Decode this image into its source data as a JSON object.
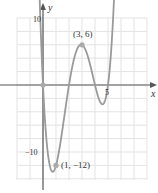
{
  "chart_data": {
    "type": "line",
    "title": "",
    "xlabel": "x",
    "ylabel": "y",
    "function": "f(x) = x(x-2)(x-4)(x-5)",
    "xlim": [
      -3.3,
      8.8
    ],
    "ylim": [
      -14.5,
      12.5
    ],
    "x_ticks_labeled": [
      "5"
    ],
    "y_ticks_labeled": [
      "10",
      "-10"
    ],
    "grid": true,
    "grid_step": {
      "x": 1,
      "y": 2
    },
    "annotated_points": [
      {
        "x": 0,
        "y": 0,
        "label": ""
      },
      {
        "x": 3,
        "y": 6,
        "label": "(3, 6)"
      },
      {
        "x": 1,
        "y": -12,
        "label": "(1, −12)"
      }
    ],
    "series": [
      {
        "name": "f",
        "color": "#9a9a9a",
        "x": [
          -0.35,
          0,
          0.5,
          1,
          1.5,
          2,
          2.5,
          3,
          3.5,
          4,
          4.5,
          5,
          5.5
        ],
        "y": [
          9.6,
          0,
          -7.9,
          -12,
          -9.2,
          0,
          3.4,
          6,
          2.6,
          0,
          -1.4,
          0,
          8.25
        ]
      }
    ],
    "colors": {
      "curve": "#9a9a9a",
      "point": "#aaaaaa",
      "axis": "#555555",
      "grid": "#e3e3e3"
    }
  },
  "labels": {
    "x_axis": "x",
    "y_axis": "y",
    "y_pos": "10",
    "y_neg": "−10",
    "x_five": "5",
    "max_point": "(3, 6)",
    "min_point": "(1, −12)"
  }
}
